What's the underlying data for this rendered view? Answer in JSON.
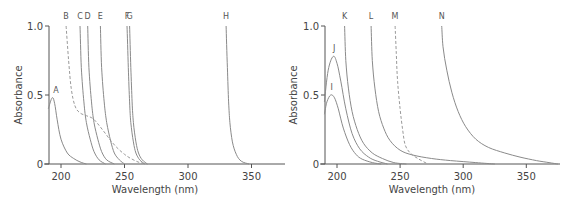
{
  "chart_data": [
    {
      "type": "line",
      "title": "",
      "xlabel": "Wavelength (nm)",
      "ylabel": "Absorbance",
      "xlim": [
        190,
        375
      ],
      "ylim": [
        0,
        1.0
      ],
      "x_ticks": [
        200,
        250,
        300,
        350
      ],
      "y_ticks": [
        0,
        0.5,
        1.0
      ],
      "y_tick_labels": [
        "0",
        "0.5",
        "1.0"
      ],
      "grid": false,
      "legend": "none (curves labeled directly at top)",
      "series": [
        {
          "name": "A",
          "style": "solid",
          "points": [
            [
              190,
              0.4
            ],
            [
              193,
              0.48
            ],
            [
              195,
              0.44
            ],
            [
              197,
              0.32
            ],
            [
              200,
              0.18
            ],
            [
              205,
              0.08
            ],
            [
              210,
              0.04
            ],
            [
              215,
              0.015
            ],
            [
              220,
              0.0
            ]
          ]
        },
        {
          "name": "B",
          "style": "dashed",
          "points": [
            [
              204,
              1.0
            ],
            [
              206,
              0.75
            ],
            [
              208,
              0.55
            ],
            [
              211,
              0.42
            ],
            [
              215,
              0.37
            ],
            [
              220,
              0.35
            ],
            [
              225,
              0.33
            ],
            [
              230,
              0.28
            ],
            [
              235,
              0.22
            ],
            [
              240,
              0.16
            ],
            [
              245,
              0.11
            ],
            [
              250,
              0.07
            ],
            [
              255,
              0.04
            ],
            [
              262,
              0.01
            ],
            [
              268,
              0.0
            ]
          ]
        },
        {
          "name": "C",
          "style": "solid",
          "points": [
            [
              215,
              1.0
            ],
            [
              216,
              0.7
            ],
            [
              218,
              0.45
            ],
            [
              220,
              0.3
            ],
            [
              223,
              0.18
            ],
            [
              226,
              0.09
            ],
            [
              230,
              0.03
            ],
            [
              235,
              0.0
            ]
          ]
        },
        {
          "name": "D",
          "style": "solid",
          "points": [
            [
              221,
              1.0
            ],
            [
              222,
              0.7
            ],
            [
              224,
              0.45
            ],
            [
              226,
              0.3
            ],
            [
              229,
              0.18
            ],
            [
              232,
              0.09
            ],
            [
              236,
              0.03
            ],
            [
              242,
              0.0
            ]
          ]
        },
        {
          "name": "E",
          "style": "solid",
          "points": [
            [
              231,
              1.0
            ],
            [
              232,
              0.7
            ],
            [
              234,
              0.45
            ],
            [
              236,
              0.3
            ],
            [
              239,
              0.17
            ],
            [
              242,
              0.08
            ],
            [
              246,
              0.03
            ],
            [
              250,
              0.0
            ]
          ]
        },
        {
          "name": "F",
          "style": "solid",
          "points": [
            [
              252,
              1.0
            ],
            [
              253,
              0.7
            ],
            [
              254,
              0.45
            ],
            [
              255,
              0.3
            ],
            [
              257,
              0.16
            ],
            [
              259,
              0.08
            ],
            [
              262,
              0.03
            ],
            [
              266,
              0.0
            ]
          ]
        },
        {
          "name": "G",
          "style": "solid",
          "points": [
            [
              254,
              1.0
            ],
            [
              255,
              0.7
            ],
            [
              256,
              0.45
            ],
            [
              257,
              0.3
            ],
            [
              259,
              0.16
            ],
            [
              261,
              0.08
            ],
            [
              264,
              0.03
            ],
            [
              268,
              0.0
            ]
          ]
        },
        {
          "name": "H",
          "style": "solid",
          "points": [
            [
              330,
              1.0
            ],
            [
              331,
              0.7
            ],
            [
              332,
              0.45
            ],
            [
              333,
              0.3
            ],
            [
              335,
              0.16
            ],
            [
              338,
              0.07
            ],
            [
              342,
              0.02
            ],
            [
              348,
              0.0
            ]
          ]
        }
      ]
    },
    {
      "type": "line",
      "title": "",
      "xlabel": "Wavelength (nm)",
      "ylabel": "Absorbance",
      "xlim": [
        190,
        375
      ],
      "ylim": [
        0,
        1.0
      ],
      "x_ticks": [
        200,
        250,
        300,
        350
      ],
      "y_ticks": [
        0,
        0.5,
        1.0
      ],
      "y_tick_labels": [
        "0",
        "0.5",
        "1.0"
      ],
      "grid": false,
      "legend": "none (curves labeled directly at top)",
      "series": [
        {
          "name": "I",
          "style": "solid",
          "points": [
            [
              190,
              0.36
            ],
            [
              192,
              0.45
            ],
            [
              195,
              0.5
            ],
            [
              198,
              0.48
            ],
            [
              201,
              0.4
            ],
            [
              205,
              0.26
            ],
            [
              210,
              0.14
            ],
            [
              215,
              0.07
            ],
            [
              220,
              0.035
            ],
            [
              228,
              0.01
            ],
            [
              235,
              0.0
            ]
          ]
        },
        {
          "name": "J",
          "style": "solid",
          "points": [
            [
              190,
              0.45
            ],
            [
              193,
              0.68
            ],
            [
              197,
              0.78
            ],
            [
              200,
              0.73
            ],
            [
              203,
              0.6
            ],
            [
              207,
              0.4
            ],
            [
              212,
              0.22
            ],
            [
              218,
              0.11
            ],
            [
              225,
              0.05
            ],
            [
              232,
              0.02
            ],
            [
              240,
              0.0
            ]
          ]
        },
        {
          "name": "K",
          "style": "solid",
          "points": [
            [
              206,
              1.0
            ],
            [
              207,
              0.75
            ],
            [
              209,
              0.55
            ],
            [
              212,
              0.38
            ],
            [
              216,
              0.25
            ],
            [
              221,
              0.15
            ],
            [
              228,
              0.08
            ],
            [
              236,
              0.04
            ],
            [
              245,
              0.01
            ],
            [
              255,
              0.0
            ]
          ]
        },
        {
          "name": "L",
          "style": "solid",
          "points": [
            [
              227,
              1.0
            ],
            [
              228,
              0.75
            ],
            [
              230,
              0.55
            ],
            [
              233,
              0.38
            ],
            [
              237,
              0.26
            ],
            [
              242,
              0.17
            ],
            [
              250,
              0.1
            ],
            [
              260,
              0.065
            ],
            [
              275,
              0.04
            ],
            [
              290,
              0.025
            ],
            [
              310,
              0.01
            ],
            [
              325,
              0.0
            ]
          ]
        },
        {
          "name": "M",
          "style": "dashed",
          "points": [
            [
              246,
              1.0
            ],
            [
              247,
              0.8
            ],
            [
              248,
              0.6
            ],
            [
              250,
              0.4
            ],
            [
              252,
              0.25
            ],
            [
              254,
              0.14
            ],
            [
              258,
              0.08
            ],
            [
              264,
              0.04
            ],
            [
              272,
              0.0
            ]
          ]
        },
        {
          "name": "N",
          "style": "solid",
          "points": [
            [
              283,
              1.0
            ],
            [
              284,
              0.85
            ],
            [
              287,
              0.68
            ],
            [
              291,
              0.52
            ],
            [
              296,
              0.38
            ],
            [
              302,
              0.27
            ],
            [
              310,
              0.18
            ],
            [
              320,
              0.12
            ],
            [
              333,
              0.08
            ],
            [
              345,
              0.05
            ],
            [
              358,
              0.025
            ],
            [
              368,
              0.01
            ],
            [
              375,
              0.0
            ]
          ]
        }
      ]
    }
  ]
}
